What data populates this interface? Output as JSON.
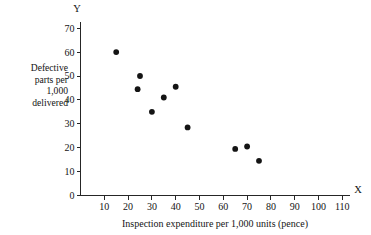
{
  "chart_data": {
    "type": "scatter",
    "title": "",
    "xlabel": "Inspection expenditure per 1,000 units (pence)",
    "ylabel": "Defective parts per 1,000 delivered",
    "x_axis_name": "X",
    "y_axis_name": "Y",
    "xlim": [
      0,
      115
    ],
    "ylim": [
      0,
      73
    ],
    "xticks": [
      10,
      20,
      30,
      40,
      50,
      60,
      70,
      80,
      90,
      100,
      110
    ],
    "yticks": [
      0,
      10,
      20,
      30,
      40,
      50,
      60,
      70
    ],
    "xtick_labels": [
      "10",
      "20",
      "30",
      "40",
      "50",
      "60",
      "70",
      "80",
      "90",
      "100",
      "110"
    ],
    "ytick_labels": [
      "0",
      "10",
      "20",
      "30",
      "40",
      "50",
      "60",
      "70"
    ],
    "grid": false,
    "legend": false,
    "marker": "filled-circle",
    "marker_color": "#141414",
    "points": [
      {
        "x": 15,
        "y": 60
      },
      {
        "x": 25,
        "y": 50
      },
      {
        "x": 24,
        "y": 44.5
      },
      {
        "x": 35,
        "y": 41
      },
      {
        "x": 40,
        "y": 45.5
      },
      {
        "x": 30,
        "y": 35
      },
      {
        "x": 45,
        "y": 28.5
      },
      {
        "x": 65,
        "y": 19.5
      },
      {
        "x": 70,
        "y": 20.5
      },
      {
        "x": 75,
        "y": 14.5
      }
    ],
    "ylabel_lines": [
      "Defective",
      "parts  per",
      "1,000",
      "delivered"
    ]
  }
}
